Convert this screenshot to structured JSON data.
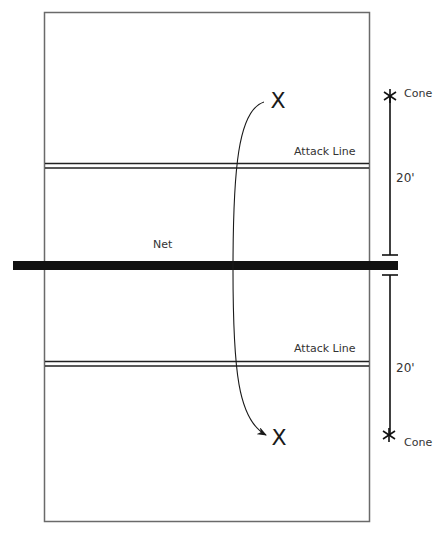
{
  "diagram": {
    "type": "volleyball-court-drill",
    "colors": {
      "court_line": "#6a6a6a",
      "net": "#111111",
      "ink": "#1a1a1a",
      "background": "#ffffff"
    },
    "labels": {
      "net": "Net",
      "attack_line_top": "Attack Line",
      "attack_line_bottom": "Attack Line",
      "cone_top": "Cone",
      "cone_bottom": "Cone",
      "distance_top": "20'",
      "distance_bottom": "20'"
    },
    "markers": {
      "player_top": "X",
      "player_bottom": "X",
      "cone_symbol_top": "✱",
      "cone_symbol_bottom": "✱"
    }
  }
}
